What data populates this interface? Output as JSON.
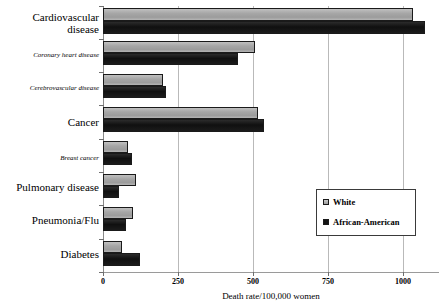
{
  "chart_data": {
    "type": "bar",
    "orientation": "horizontal",
    "title": "",
    "xlabel": "Death rate/100,000 women",
    "ylabel": "",
    "xlim": [
      0,
      1120
    ],
    "xticks": [
      0,
      250,
      500,
      750,
      1000
    ],
    "xtick_labels": [
      "0",
      "250",
      "500",
      "750",
      "1000"
    ],
    "grid": "vertical",
    "legend_position": "middle-right",
    "categories": [
      "Cardiovascular disease",
      "Coronary heart disease",
      "Cerebrovascular disease",
      "Cancer",
      "Breast cancer",
      "Pulmonary disease",
      "Pneumonia/Flu",
      "Diabetes"
    ],
    "category_styles": [
      "major",
      "minor",
      "minor",
      "major",
      "minor",
      "major",
      "major",
      "major"
    ],
    "series": [
      {
        "name": "White",
        "color": "#a8a8a8",
        "values": [
          1033,
          507,
          200,
          517,
          83,
          110,
          100,
          63
        ]
      },
      {
        "name": "African-American",
        "color": "#1c1c1c",
        "values": [
          1073,
          450,
          210,
          537,
          97,
          53,
          77,
          123
        ]
      }
    ]
  },
  "legend": {
    "items": [
      {
        "label": "White",
        "swatch": "white-swatch-icon"
      },
      {
        "label": "African-American",
        "swatch": "african-american-swatch-icon"
      }
    ]
  },
  "axis": {
    "x_title": "Death rate/100,000 women",
    "tick_labels": [
      "0",
      "250",
      "500",
      "750",
      "1000"
    ]
  }
}
